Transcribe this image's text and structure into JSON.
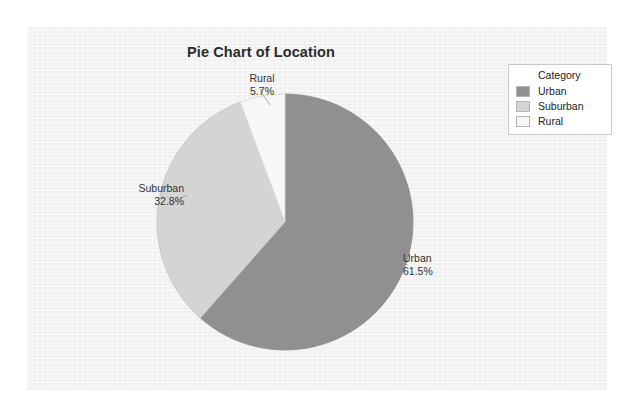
{
  "page": {
    "background_color": "#ffffff",
    "panel_color": "#f2f2f2"
  },
  "chart_data": {
    "type": "pie",
    "title": "Pie Chart of Location",
    "xlabel": "",
    "ylabel": "",
    "categories": [
      "Urban",
      "Suburban",
      "Rural"
    ],
    "values": [
      61.5,
      32.8,
      5.7
    ],
    "value_suffix": "%",
    "start_angle_deg": 0,
    "direction": "clockwise",
    "grid": false,
    "legend_position": "top-right",
    "legend_title": "Category",
    "slices": [
      {
        "name": "Urban",
        "value": 61.5,
        "label": "Urban",
        "percent_label": "61.5%",
        "color": "#909090",
        "stroke": "#8a8a8a"
      },
      {
        "name": "Suburban",
        "value": 32.8,
        "label": "Suburban",
        "percent_label": "32.8%",
        "color": "#d4d4d4",
        "stroke": "#c4c4c4"
      },
      {
        "name": "Rural",
        "value": 5.7,
        "label": "Rural",
        "percent_label": "5.7%",
        "color": "#f7f7f7",
        "stroke": "#d8d8d8"
      }
    ]
  },
  "legend": {
    "title": "Category",
    "items": [
      {
        "label": "Urban",
        "color": "#909090"
      },
      {
        "label": "Suburban",
        "color": "#d4d4d4"
      },
      {
        "label": "Rural",
        "color": "#f7f7f7"
      }
    ]
  }
}
